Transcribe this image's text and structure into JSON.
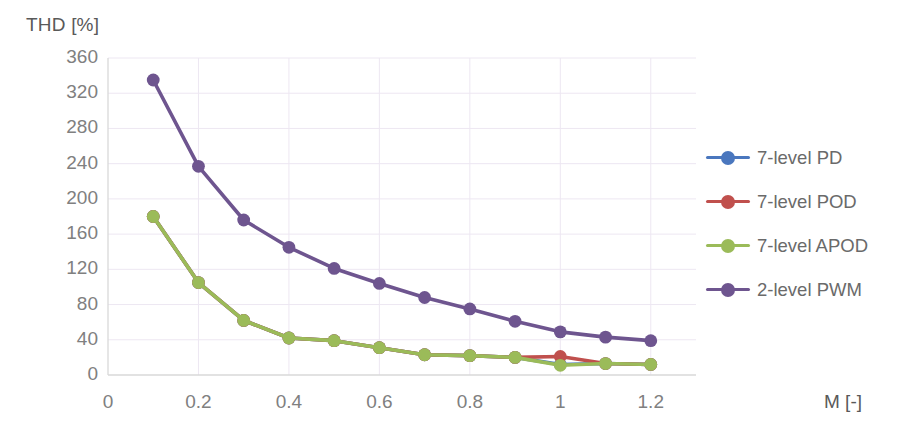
{
  "chart_data": {
    "type": "line",
    "title": "",
    "xlabel": "M [-]",
    "ylabel": "THD [%]",
    "xlim": [
      0,
      1.3
    ],
    "ylim": [
      0,
      360
    ],
    "grid": true,
    "legend_position": "right",
    "x": [
      0.1,
      0.2,
      0.3,
      0.4,
      0.5,
      0.6,
      0.7,
      0.8,
      0.9,
      1.0,
      1.1,
      1.2
    ],
    "xticks": [
      "0",
      "0.2",
      "0.4",
      "0.6",
      "0.8",
      "1",
      "1.2"
    ],
    "xtick_values": [
      0,
      0.2,
      0.4,
      0.6,
      0.8,
      1.0,
      1.2
    ],
    "yticks": [
      "0",
      "40",
      "80",
      "120",
      "160",
      "200",
      "240",
      "280",
      "320",
      "360"
    ],
    "ytick_values": [
      0,
      40,
      80,
      120,
      160,
      200,
      240,
      280,
      320,
      360
    ],
    "series": [
      {
        "name": "7-level PD",
        "color": "#4A77BE",
        "values": [
          180,
          105,
          62,
          42,
          39,
          31,
          23,
          22,
          20,
          12,
          13,
          12
        ]
      },
      {
        "name": "7-level POD",
        "color": "#C0504D",
        "values": [
          180,
          105,
          62,
          42,
          39,
          31,
          23,
          22,
          20,
          21,
          13,
          12
        ]
      },
      {
        "name": "7-level APOD",
        "color": "#9BBB59",
        "values": [
          180,
          105,
          62,
          42,
          39,
          31,
          23,
          22,
          20,
          11,
          13,
          12
        ]
      },
      {
        "name": "2-level PWM",
        "color": "#6E558F",
        "values": [
          335,
          237,
          176,
          145,
          121,
          104,
          88,
          75,
          61,
          49,
          43,
          39
        ]
      }
    ]
  },
  "legend": {
    "items": [
      {
        "label": "7-level PD",
        "color": "#4A77BE"
      },
      {
        "label": "7-level POD",
        "color": "#C0504D"
      },
      {
        "label": "7-level APOD",
        "color": "#9BBB59"
      },
      {
        "label": "2-level PWM",
        "color": "#6E558F"
      }
    ]
  },
  "axes": {
    "y_title": "THD [%]",
    "x_title": "M [-]"
  }
}
